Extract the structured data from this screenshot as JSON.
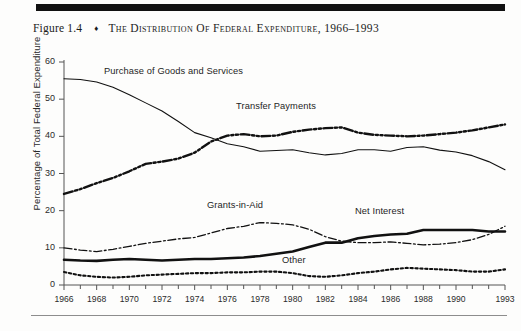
{
  "figure": {
    "number": "Figure 1.4",
    "diamond": "♦",
    "title": "The Distribution of Federal Expenditure, 1966–1993"
  },
  "chart_data": {
    "type": "line",
    "title": "The Distribution of Federal Expenditure, 1966–1993",
    "xlabel": "",
    "ylabel": "Percentage of Total Federal Expenditure",
    "xlim": [
      1966,
      1993
    ],
    "ylim": [
      0,
      60
    ],
    "ytick_values": [
      0,
      10,
      20,
      30,
      40,
      50,
      60
    ],
    "ytick_labels": [
      "0",
      "10",
      "20",
      "30",
      "40",
      "50",
      "60"
    ],
    "xtick_values": [
      1966,
      1968,
      1970,
      1972,
      1974,
      1976,
      1978,
      1980,
      1982,
      1984,
      1986,
      1988,
      1990,
      1993
    ],
    "xtick_labels": [
      "1966",
      "1968",
      "1970",
      "1972",
      "1974",
      "1976",
      "1978",
      "1980",
      "1982",
      "1984",
      "1986",
      "1988",
      "1990",
      "1993"
    ],
    "grid": false,
    "legend_position": "inline-annotations",
    "x": [
      1966,
      1967,
      1968,
      1969,
      1970,
      1971,
      1972,
      1973,
      1974,
      1975,
      1976,
      1977,
      1978,
      1979,
      1980,
      1981,
      1982,
      1983,
      1984,
      1985,
      1986,
      1987,
      1988,
      1989,
      1990,
      1991,
      1992,
      1993
    ],
    "series": [
      {
        "name": "Purchase of Goods and Services",
        "style": "solid-thin",
        "color": "#111111",
        "values": [
          55.5,
          55.3,
          54.6,
          53.2,
          51.2,
          49.0,
          46.8,
          44.0,
          41.0,
          39.6,
          38.0,
          37.2,
          36.0,
          36.2,
          36.4,
          35.6,
          35.0,
          35.4,
          36.4,
          36.4,
          36.0,
          37.0,
          37.2,
          36.3,
          35.8,
          34.8,
          33.2,
          31.0
        ]
      },
      {
        "name": "Transfer Payments",
        "style": "dash-dot-dot-thick",
        "color": "#111111",
        "values": [
          24.5,
          25.8,
          27.4,
          28.8,
          30.6,
          32.6,
          33.2,
          34.0,
          35.6,
          38.6,
          40.2,
          40.6,
          40.0,
          40.2,
          41.2,
          41.8,
          42.2,
          42.4,
          41.0,
          40.4,
          40.2,
          40.0,
          40.2,
          40.6,
          41.0,
          41.6,
          42.4,
          43.2
        ]
      },
      {
        "name": "Grants-in-Aid",
        "style": "dash-dot-thin",
        "color": "#111111",
        "values": [
          10.0,
          9.4,
          9.0,
          9.6,
          10.4,
          11.2,
          11.8,
          12.4,
          12.8,
          14.0,
          15.2,
          15.8,
          16.8,
          16.6,
          16.2,
          15.0,
          13.0,
          11.8,
          11.4,
          11.4,
          11.6,
          11.2,
          10.8,
          11.0,
          11.4,
          12.2,
          13.6,
          15.8
        ]
      },
      {
        "name": "Net Interest",
        "style": "solid-thick",
        "color": "#111111",
        "values": [
          6.8,
          6.6,
          6.5,
          6.8,
          7.0,
          6.8,
          6.6,
          6.8,
          7.0,
          7.0,
          7.2,
          7.4,
          7.8,
          8.4,
          9.0,
          10.2,
          11.4,
          11.4,
          12.6,
          13.2,
          13.6,
          13.8,
          14.8,
          14.8,
          14.8,
          14.8,
          14.4,
          14.4
        ]
      },
      {
        "name": "Other",
        "style": "dotted-thick",
        "color": "#111111",
        "values": [
          3.5,
          2.6,
          2.2,
          2.0,
          2.2,
          2.6,
          2.8,
          3.0,
          3.2,
          3.2,
          3.4,
          3.4,
          3.6,
          3.6,
          3.2,
          2.4,
          2.2,
          2.6,
          3.2,
          3.6,
          4.2,
          4.6,
          4.4,
          4.2,
          4.0,
          3.6,
          3.6,
          4.2
        ]
      }
    ]
  },
  "annotations": [
    {
      "label": "Purchase of Goods and Services",
      "left": 104,
      "top": 66
    },
    {
      "label": "Transfer Payments",
      "left": 236,
      "top": 101
    },
    {
      "label": "Grants-in-Aid",
      "left": 207,
      "top": 200
    },
    {
      "label": "Net Interest",
      "left": 355,
      "top": 206
    },
    {
      "label": "Other",
      "left": 282,
      "top": 255
    }
  ]
}
